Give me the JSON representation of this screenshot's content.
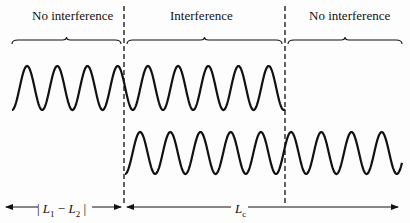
{
  "regions": [
    {
      "label": "No interference",
      "x_start": 12,
      "x_end": 121
    },
    {
      "label": "Interference",
      "x_start": 127,
      "x_end": 282
    },
    {
      "label": "No interference",
      "x_start": 288,
      "x_end": 402
    }
  ],
  "dividers": [
    124,
    285
  ],
  "waves": [
    {
      "name": "wave-1",
      "x_start": 12,
      "x_end": 285,
      "y_center": 88,
      "amplitude": 22,
      "period": 30.2,
      "start_phase": "trough"
    },
    {
      "name": "wave-2",
      "x_start": 125,
      "x_end": 402,
      "y_center": 153,
      "amplitude": 21,
      "period": 30.2,
      "start_phase": "trough"
    }
  ],
  "dimensions": {
    "path_difference": {
      "label_left": "| ",
      "L1": "L",
      "sub1": "1",
      "minus": " − ",
      "L2": "L",
      "sub2": "2",
      "label_right": " |"
    },
    "coherence_length": {
      "label": "L",
      "sub": "c"
    }
  },
  "colors": {
    "ink": "#111111",
    "background": "#fdfdfd"
  }
}
